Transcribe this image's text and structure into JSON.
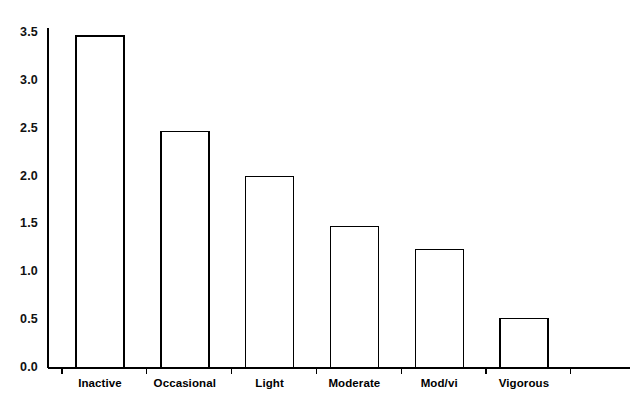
{
  "chart_data": {
    "type": "bar",
    "title": "",
    "subtitle": "",
    "xlabel": "",
    "ylabel": "",
    "categories": [
      "Inactive",
      "Occasional",
      "Light",
      "Moderate",
      "Mod/vi",
      "Vigorous"
    ],
    "values": [
      3.47,
      2.47,
      2.0,
      1.48,
      1.24,
      0.52
    ],
    "ylim": [
      0.0,
      3.5
    ],
    "ytick_labels": [
      "0.0",
      "0.5",
      "1.0",
      "1.5",
      "2.0",
      "2.5",
      "3.0",
      "3.5"
    ],
    "ytick_values": [
      0.0,
      0.5,
      1.0,
      1.5,
      2.0,
      2.5,
      3.0,
      3.5
    ],
    "grid": false,
    "legend": null,
    "legend_position": "none",
    "bar_fill_color": "#ffffff",
    "bar_edge_color": "#000000",
    "axis_color": "#000000",
    "background_color": "#ffffff",
    "annotations": []
  }
}
